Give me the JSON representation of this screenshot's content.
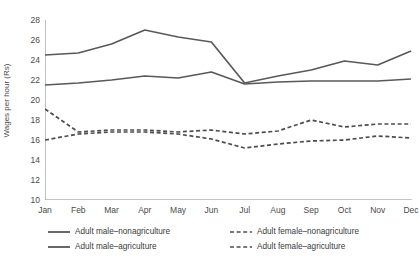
{
  "chart_data": {
    "type": "line",
    "title": "",
    "xlabel": "",
    "ylabel": "Wages per hour (Rs)",
    "categories": [
      "Jan",
      "Feb",
      "Mar",
      "Apr",
      "May",
      "Jun",
      "Jul",
      "Aug",
      "Sep",
      "Oct",
      "Nov",
      "Dec"
    ],
    "ylim": [
      10,
      28
    ],
    "yticks": [
      10,
      12,
      14,
      16,
      18,
      20,
      22,
      24,
      26,
      28
    ],
    "grid": false,
    "legend_position": "bottom",
    "series": [
      {
        "name": "Adult male–nonagriculture",
        "style": "solid",
        "color": "#595959",
        "values": [
          24.5,
          24.7,
          25.6,
          27.0,
          26.3,
          25.8,
          21.7,
          22.4,
          23.0,
          23.9,
          23.5,
          24.9
        ]
      },
      {
        "name": "Adult male–agriculture",
        "style": "solid",
        "color": "#595959",
        "values": [
          21.5,
          21.7,
          22.0,
          22.4,
          22.2,
          22.8,
          21.6,
          21.8,
          21.9,
          21.9,
          21.9,
          22.1
        ]
      },
      {
        "name": "Adult female–nonagriculture",
        "style": "dashed",
        "color": "#4d4d4d",
        "values": [
          19.1,
          16.8,
          17.0,
          17.0,
          16.8,
          17.0,
          16.6,
          16.9,
          18.0,
          17.3,
          17.6,
          17.6
        ]
      },
      {
        "name": "Adult female–agriculture",
        "style": "dashed",
        "color": "#4d4d4d",
        "values": [
          16.0,
          16.6,
          16.8,
          16.8,
          16.6,
          16.1,
          15.2,
          15.6,
          15.9,
          16.0,
          16.4,
          16.2
        ]
      }
    ]
  },
  "legend": {
    "entries": [
      {
        "label": "Adult male–nonagriculture",
        "style": "solid"
      },
      {
        "label": "Adult male–agriculture",
        "style": "solid"
      },
      {
        "label": "Adult female–nonagriculture",
        "style": "dashed"
      },
      {
        "label": "Adult female–agriculture",
        "style": "dashed"
      }
    ]
  }
}
